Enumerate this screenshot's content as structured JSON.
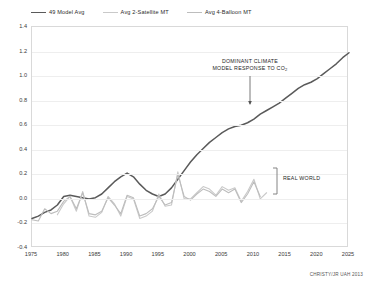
{
  "credit": "CHRISTY/JR UAH 2013",
  "annotations": {
    "model_response_line1": "DOMINANT CLIMATE",
    "model_response_line2": "MODEL RESPONSE TO CO",
    "model_response_sub": "2",
    "real_world": "REAL WORLD"
  },
  "colors": {
    "model": "#5a5a5a",
    "satellite": "#c9c9c9",
    "balloon": "#bdbdbd",
    "grid": "#eeeeee",
    "frame": "#d9d9d9",
    "text": "#1d1d1d"
  },
  "chart_data": {
    "type": "line",
    "title": "",
    "xlabel": "",
    "ylabel": "",
    "xlim": [
      1975,
      2025
    ],
    "ylim": [
      -0.4,
      1.4
    ],
    "grid": true,
    "legend_position": "top-left",
    "xticks": [
      1975,
      1980,
      1985,
      1990,
      1995,
      2000,
      2005,
      2010,
      2015,
      2020,
      2025
    ],
    "yticks": [
      -0.4,
      -0.2,
      0.0,
      0.2,
      0.4,
      0.6,
      0.8,
      1.0,
      1.2,
      1.4
    ],
    "series": [
      {
        "name": "49 Model Avg",
        "color": "#5a5a5a",
        "x": [
          1975,
          1976,
          1977,
          1978,
          1979,
          1980,
          1981,
          1982,
          1983,
          1984,
          1985,
          1986,
          1987,
          1988,
          1989,
          1990,
          1991,
          1992,
          1993,
          1994,
          1995,
          1996,
          1997,
          1998,
          1999,
          2000,
          2001,
          2002,
          2003,
          2004,
          2005,
          2006,
          2007,
          2008,
          2009,
          2010,
          2011,
          2012,
          2013,
          2014,
          2015,
          2016,
          2017,
          2018,
          2019,
          2020,
          2021,
          2022,
          2023,
          2024,
          2025
        ],
        "values": [
          -0.16,
          -0.14,
          -0.11,
          -0.09,
          -0.05,
          0.02,
          0.03,
          0.02,
          0.01,
          0.0,
          0.01,
          0.04,
          0.09,
          0.14,
          0.18,
          0.21,
          0.18,
          0.12,
          0.07,
          0.04,
          0.02,
          0.04,
          0.09,
          0.16,
          0.23,
          0.3,
          0.36,
          0.41,
          0.46,
          0.5,
          0.54,
          0.57,
          0.59,
          0.6,
          0.62,
          0.65,
          0.69,
          0.72,
          0.75,
          0.78,
          0.82,
          0.86,
          0.9,
          0.93,
          0.95,
          0.98,
          1.02,
          1.06,
          1.1,
          1.15,
          1.19
        ]
      },
      {
        "name": "Avg 2-Satellite MT",
        "color": "#c9c9c9",
        "x": [
          1979,
          1980,
          1981,
          1982,
          1983,
          1984,
          1985,
          1986,
          1987,
          1988,
          1989,
          1990,
          1991,
          1992,
          1993,
          1994,
          1995,
          1996,
          1997,
          1998,
          1999,
          2000,
          2001,
          2002,
          2003,
          2004,
          2005,
          2006,
          2007,
          2008,
          2009,
          2010,
          2011,
          2012
        ],
        "values": [
          -0.13,
          -0.04,
          0.02,
          -0.1,
          0.06,
          -0.14,
          -0.15,
          -0.11,
          0.02,
          -0.04,
          -0.14,
          0.02,
          0.0,
          -0.16,
          -0.14,
          -0.1,
          0.04,
          -0.06,
          -0.05,
          0.22,
          0.0,
          0.0,
          0.05,
          0.1,
          0.08,
          0.03,
          0.1,
          0.07,
          0.09,
          -0.02,
          0.06,
          0.16,
          0.0,
          0.05
        ]
      },
      {
        "name": "Avg 4-Balloon MT",
        "color": "#bdbdbd",
        "x": [
          1975,
          1976,
          1977,
          1978,
          1979,
          1980,
          1981,
          1982,
          1983,
          1984,
          1985,
          1986,
          1987,
          1988,
          1989,
          1990,
          1991,
          1992,
          1993,
          1994,
          1995,
          1996,
          1997,
          1998,
          1999,
          2000,
          2001,
          2002,
          2003,
          2004,
          2005,
          2006,
          2007,
          2008,
          2009,
          2010,
          2011
        ],
        "values": [
          -0.17,
          -0.18,
          -0.08,
          -0.12,
          -0.1,
          -0.02,
          0.02,
          -0.08,
          0.05,
          -0.12,
          -0.13,
          -0.1,
          0.01,
          -0.05,
          -0.12,
          0.03,
          0.01,
          -0.14,
          -0.12,
          -0.08,
          0.02,
          -0.05,
          -0.03,
          0.2,
          0.02,
          -0.01,
          0.04,
          0.08,
          0.06,
          0.02,
          0.08,
          0.05,
          0.08,
          -0.03,
          0.04,
          0.14,
          0.02
        ]
      }
    ]
  }
}
